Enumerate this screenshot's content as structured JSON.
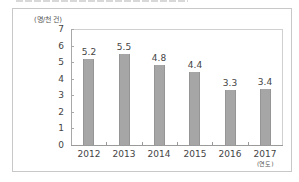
{
  "chart_data": {
    "type": "bar",
    "title": "",
    "categories": [
      "2012",
      "2013",
      "2014",
      "2015",
      "2016",
      "2017"
    ],
    "values": [
      5.2,
      5.5,
      4.8,
      4.4,
      3.3,
      3.4
    ],
    "data_labels": [
      "5.2",
      "5.5",
      "4.8",
      "4.4",
      "3.3",
      "3.4"
    ],
    "xlabel": "(연도)",
    "ylabel": "(명/천 건)",
    "ylim": [
      0,
      7
    ],
    "yticks": [
      "0",
      "1",
      "2",
      "3",
      "4",
      "5",
      "6",
      "7"
    ],
    "grid": false,
    "legend": null,
    "bar_color": "#a6a6a6"
  }
}
